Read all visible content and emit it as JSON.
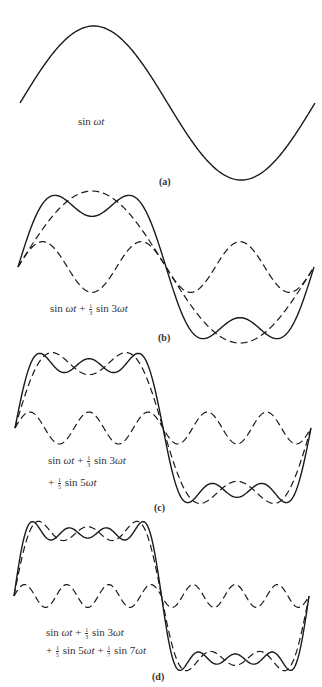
{
  "figure": {
    "stroke_color": "#1a1a1a",
    "panels": [
      {
        "id": "a",
        "label": "(a)",
        "formula_lines": [
          "sin ωt"
        ],
        "x_range": [
          20,
          315
        ],
        "baseline_y": 103,
        "amplitude": 77,
        "curves": [
          {
            "style": "solid",
            "terms": [
              [
                1,
                1
              ]
            ]
          }
        ]
      },
      {
        "id": "b",
        "label": "(b)",
        "formula_lines": [
          "sin ωt + ⅓ sin 3ωt"
        ],
        "x_range": [
          18,
          314
        ],
        "baseline_y": 267,
        "amplitude": 76,
        "curves": [
          {
            "style": "dashed",
            "terms": [
              [
                1,
                1
              ]
            ]
          },
          {
            "style": "dashed",
            "terms": [
              [
                3,
                0.3333
              ]
            ]
          },
          {
            "style": "solid",
            "terms": [
              [
                1,
                1
              ],
              [
                3,
                0.3333
              ]
            ]
          }
        ]
      },
      {
        "id": "c",
        "label": "(c)",
        "formula_lines": [
          "sin ωt + ⅓ sin 3ωt",
          "+ ⅕ sin 5ωt"
        ],
        "x_range": [
          15,
          311
        ],
        "baseline_y": 428,
        "amplitude": 80,
        "curves": [
          {
            "style": "dashed",
            "terms": [
              [
                1,
                1
              ],
              [
                3,
                0.3333
              ]
            ]
          },
          {
            "style": "dashed",
            "terms": [
              [
                5,
                0.2
              ]
            ]
          },
          {
            "style": "solid",
            "terms": [
              [
                1,
                1
              ],
              [
                3,
                0.3333
              ],
              [
                5,
                0.2
              ]
            ]
          }
        ]
      },
      {
        "id": "d",
        "label": "(d)",
        "formula_lines": [
          "sin ωt + ⅓ sin 3ωt",
          "+ ⅕ sin 5ωt + ⅐ sin 7ωt"
        ],
        "x_range": [
          14,
          309
        ],
        "baseline_y": 596,
        "amplitude": 80,
        "curves": [
          {
            "style": "dashed",
            "terms": [
              [
                1,
                1
              ],
              [
                3,
                0.3333
              ],
              [
                5,
                0.2
              ]
            ]
          },
          {
            "style": "dashed",
            "terms": [
              [
                7,
                0.142857
              ]
            ]
          },
          {
            "style": "solid",
            "terms": [
              [
                1,
                1
              ],
              [
                3,
                0.3333
              ],
              [
                5,
                0.2
              ],
              [
                7,
                0.142857
              ]
            ]
          }
        ]
      }
    ]
  },
  "labels": {
    "a": {
      "panel": "(a)",
      "f1": "sin ",
      "f1w": "ωt"
    },
    "b": {
      "panel": "(b)",
      "f1": "sin ",
      "f1w": "ωt",
      "plus1": " + ",
      "n1": "1",
      "d1": "3",
      "s3": " sin 3",
      "s3w": "ωt"
    },
    "c": {
      "panel": "(c)",
      "f1": "sin ",
      "f1w": "ωt",
      "plus1": " + ",
      "n1": "1",
      "d1": "3",
      "s3": " sin 3",
      "s3w": "ωt",
      "plus2": "+ ",
      "n2": "1",
      "d2": "5",
      "s5": " sin 5",
      "s5w": "ωt"
    },
    "d": {
      "panel": "(d)",
      "f1": "sin ",
      "f1w": "ωt",
      "plus1": " + ",
      "n1": "1",
      "d1": "3",
      "s3": " sin 3",
      "s3w": "ωt",
      "plus2": "+ ",
      "n2": "1",
      "d2": "5",
      "s5": " sin 5",
      "s5w": "ωt",
      "plus3": " + ",
      "n3": "1",
      "d3": "7",
      "s7": " sin 7",
      "s7w": "ωt"
    }
  }
}
